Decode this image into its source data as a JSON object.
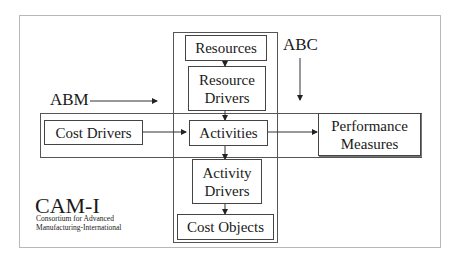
{
  "diagram": {
    "title_labels": {
      "abm": "ABM",
      "abc": "ABC"
    },
    "vertical_flow": [
      {
        "id": "resources",
        "label": "Resources"
      },
      {
        "id": "resource_drivers",
        "label": "Resource\nDrivers",
        "line1": "Resource",
        "line2": "Drivers"
      },
      {
        "id": "activities",
        "label": "Activities"
      },
      {
        "id": "activity_drivers",
        "label": "Activity\nDrivers",
        "line1": "Activity",
        "line2": "Drivers"
      },
      {
        "id": "cost_objects",
        "label": "Cost Objects"
      }
    ],
    "horizontal_flow": [
      {
        "id": "cost_drivers",
        "label": "Cost Drivers"
      },
      {
        "id": "activities",
        "label": "Activities"
      },
      {
        "id": "performance_measures",
        "label": "Performance\nMeasures",
        "line1": "Performance",
        "line2": "Measures"
      }
    ],
    "organization": {
      "name": "CAM-I",
      "full_name_line1": "Consortium for Advanced",
      "full_name_line2": "Manufacturing-International"
    },
    "colors": {
      "line": "#333333",
      "frame": "#b8b8b8",
      "text": "#1a1a1a"
    }
  }
}
